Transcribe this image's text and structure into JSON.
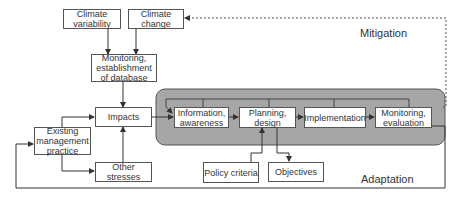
{
  "diagram": {
    "boxes": {
      "climate_variability": "Climate variability",
      "climate_change": "Climate change",
      "monitoring_database": "Monitoring, establishment of database",
      "impacts": "Impacts",
      "existing_practice": "Existing management practice",
      "other_stresses": "Other stresses",
      "information": "Information, awareness",
      "planning": "Planning, design",
      "implementation": "Implementation",
      "monitoring_eval": "Monitoring, evaluation",
      "policy": "Policy criteria",
      "objectives": "Objectives"
    },
    "labels": {
      "mitigation": "Mitigation",
      "adaptation": "Adaptation"
    },
    "colors": {
      "panel": "#a6a6a6",
      "line": "#444444"
    }
  }
}
